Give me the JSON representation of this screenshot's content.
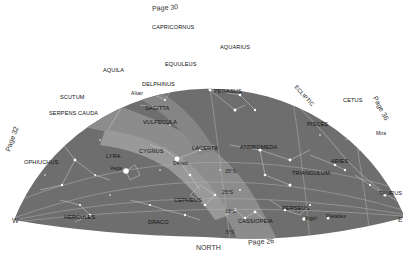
{
  "map": {
    "type": "star-chart",
    "colors": {
      "sky": "#6e6e6e",
      "milky_way": "#8c8c8c",
      "milky_way_light": "#9a9a9a",
      "lines": "#c8c8c8",
      "stars": "#ffffff",
      "labels": "#111111",
      "background": "#ffffff"
    },
    "directions": {
      "west": "W",
      "east": "E",
      "north": "NORTH"
    },
    "page_refs": {
      "top": "Page 30",
      "left": "Page 32",
      "right": "Page 36",
      "bottom": "Page 26"
    },
    "ecliptic_label": "ECLIPTIC",
    "constellations": [
      {
        "name": "CAPRICORNUS",
        "x": 152,
        "y": 28
      },
      {
        "name": "AQUARIUS",
        "x": 220,
        "y": 46
      },
      {
        "name": "EQUULEUS",
        "x": 165,
        "y": 62
      },
      {
        "name": "AQUILA",
        "x": 103,
        "y": 68
      },
      {
        "name": "DELPHINUS",
        "x": 142,
        "y": 82
      },
      {
        "name": "SCUTUM",
        "x": 60,
        "y": 95
      },
      {
        "name": "PEGASUS",
        "x": 214,
        "y": 89
      },
      {
        "name": "CETUS",
        "x": 343,
        "y": 98
      },
      {
        "name": "SERPENS CAUDA",
        "x": 49,
        "y": 111
      },
      {
        "name": "SAGITTA",
        "x": 145,
        "y": 106
      },
      {
        "name": "VULPECULA",
        "x": 143,
        "y": 120
      },
      {
        "name": "PISCES",
        "x": 307,
        "y": 122
      },
      {
        "name": "OPHIUCHUS",
        "x": 24,
        "y": 160
      },
      {
        "name": "LYRA",
        "x": 106,
        "y": 154
      },
      {
        "name": "CYGNUS",
        "x": 139,
        "y": 149
      },
      {
        "name": "LACERTA",
        "x": 192,
        "y": 146
      },
      {
        "name": "ANDROMEDA",
        "x": 240,
        "y": 145
      },
      {
        "name": "ARIES",
        "x": 331,
        "y": 159
      },
      {
        "name": "TRIANGULUM",
        "x": 292,
        "y": 171
      },
      {
        "name": "CEPHEUS",
        "x": 174,
        "y": 198
      },
      {
        "name": "TAURUS",
        "x": 379,
        "y": 191
      },
      {
        "name": "PERSEUS",
        "x": 282,
        "y": 206
      },
      {
        "name": "HERCULES",
        "x": 64,
        "y": 215
      },
      {
        "name": "DRACO",
        "x": 148,
        "y": 220
      },
      {
        "name": "CASSIOPEIA",
        "x": 238,
        "y": 219
      }
    ],
    "stars": [
      {
        "name": "Altair",
        "x": 126,
        "y": 93
      },
      {
        "name": "Vega",
        "x": 126,
        "y": 171
      },
      {
        "name": "Deneb",
        "x": 177,
        "y": 159
      },
      {
        "name": "Mira",
        "x": 376,
        "y": 131
      },
      {
        "name": "Algol",
        "x": 304,
        "y": 219
      },
      {
        "name": "Pleiades",
        "x": 328,
        "y": 218
      }
    ],
    "latitude_marks": [
      "35°S",
      "25°S",
      "15°S",
      "5°S"
    ]
  }
}
